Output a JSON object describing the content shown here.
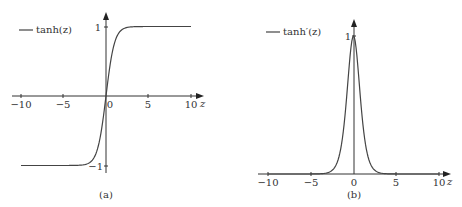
{
  "chart_data": [
    {
      "type": "line",
      "panel_label": "(a)",
      "legend": [
        "tanh(z)"
      ],
      "xlabel": "z",
      "ylabel": "",
      "xlim": [
        -10,
        10
      ],
      "ylim": [
        -1,
        1
      ],
      "x_ticks": [
        "−10",
        "−5",
        "0",
        "5",
        "10"
      ],
      "y_ticks": [
        "1",
        "−1"
      ],
      "series": [
        {
          "name": "tanh(z)",
          "function": "tanh(z)"
        }
      ],
      "grid": false,
      "legend_position": "upper left"
    },
    {
      "type": "line",
      "panel_label": "(b)",
      "legend": [
        "tanh'(z)"
      ],
      "xlabel": "z",
      "ylabel": "",
      "xlim": [
        -10,
        10
      ],
      "ylim": [
        0,
        1
      ],
      "x_ticks": [
        "−10",
        "−5",
        "0",
        "5",
        "10"
      ],
      "y_ticks": [
        "1"
      ],
      "series": [
        {
          "name": "tanh'(z)",
          "function": "1 - tanh(z)^2"
        }
      ],
      "grid": false,
      "legend_position": "upper left"
    }
  ],
  "panels": {
    "a": {
      "legend_label": "tanh(z)",
      "caption": "(a)",
      "xlabel": "z",
      "xticks": [
        "−10",
        "−5",
        "0",
        "5",
        "10"
      ],
      "ytick_top": "1",
      "ytick_bottom": "−1"
    },
    "b": {
      "legend_label": "tanh′(z)",
      "caption": "(b)",
      "xlabel": "z",
      "xticks": [
        "−10",
        "−5",
        "0",
        "5",
        "10"
      ],
      "ytick_top": "1"
    }
  }
}
